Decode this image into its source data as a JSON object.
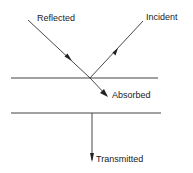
{
  "diagram": {
    "labels": {
      "reflected": "Reflected",
      "incident": "Incident",
      "absorbed": "Absorbed",
      "transmitted": "Transmitted"
    },
    "colors": {
      "line": "#333333",
      "text": "#222222",
      "background": "#ffffff"
    }
  }
}
